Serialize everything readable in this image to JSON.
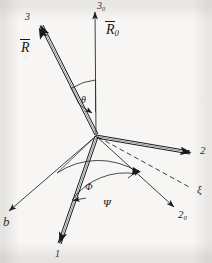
{
  "figure": {
    "type": "vector-axis-diagram",
    "background_color": "#f7f6f4",
    "ink_color": "#1a1a1a",
    "origin": {
      "x": 96,
      "y": 136
    }
  },
  "labels": {
    "axis_3_0": {
      "text": "3",
      "sub": "0",
      "x": 97,
      "y": 2
    },
    "vector_R0": {
      "text": "R",
      "sub": "0",
      "x": 106,
      "y": 24
    },
    "axis_3": {
      "text": "3",
      "sub": "",
      "x": 25,
      "y": 13
    },
    "vector_R": {
      "text": "R",
      "sub": "",
      "x": 21,
      "y": 42
    },
    "angle_theta": {
      "text": "θ",
      "sub": "",
      "x": 81,
      "y": 96
    },
    "axis_2": {
      "text": "2",
      "sub": "",
      "x": 201,
      "y": 147
    },
    "axis_xi": {
      "text": "ξ",
      "sub": "",
      "x": 198,
      "y": 186
    },
    "axis_2_0": {
      "text": "2",
      "sub": "0",
      "x": 179,
      "y": 211
    },
    "angle_phi": {
      "text": "Φ",
      "sub": "",
      "x": 85,
      "y": 183
    },
    "angle_psi": {
      "text": "Ψ",
      "sub": "",
      "x": 103,
      "y": 199
    },
    "axis_1_0": {
      "text": "b",
      "sub": "",
      "x": 3,
      "y": 217
    },
    "axis_1": {
      "text": "1",
      "sub": "",
      "x": 55,
      "y": 250
    }
  },
  "geometry": {
    "axis_3_0": {
      "x1": 96,
      "y1": 136,
      "x2": 95,
      "y2": 9,
      "style": "solid-thin",
      "arrow": true
    },
    "axis_3": {
      "x1": 96,
      "y1": 136,
      "x2": 36,
      "y2": 22,
      "style": "double-thick",
      "arrow": true
    },
    "axis_2": {
      "x1": 96,
      "y1": 136,
      "x2": 196,
      "y2": 154,
      "style": "double-thick",
      "arrow": true
    },
    "axis_1": {
      "x1": 96,
      "y1": 136,
      "x2": 59,
      "y2": 249,
      "style": "double-thick",
      "arrow": true
    },
    "axis_2_0": {
      "x1": 96,
      "y1": 136,
      "x2": 176,
      "y2": 209,
      "style": "solid-thin",
      "arrow": true
    },
    "axis_1_0": {
      "x1": 96,
      "y1": 136,
      "x2": 7,
      "y2": 213,
      "style": "solid-thin",
      "arrow": true
    },
    "axis_xi": {
      "x1": 96,
      "y1": 136,
      "x2": 192,
      "y2": 189,
      "style": "dashed",
      "arrow": false
    },
    "arc_phi": {
      "from": "axis_1_0",
      "to": "axis_xi",
      "label": "Φ"
    },
    "arc_psi": {
      "from": "axis_1",
      "to": "axis_xi",
      "label": "Ψ"
    },
    "arc_theta": {
      "from": "axis_3",
      "to": "axis_3_0",
      "label": "θ"
    }
  }
}
